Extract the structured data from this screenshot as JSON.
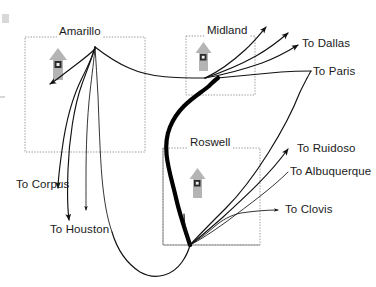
{
  "diagram": {
    "background_color": "#ffffff",
    "line_color": "#111111",
    "box_border_color": "#9a9a9a",
    "north_arrow_color": "#b4b4b4"
  },
  "regions": [
    {
      "id": "amarillo",
      "label": "Amarillo",
      "label_x": 57,
      "label_y": 27,
      "box": {
        "x": 25,
        "y": 37,
        "w": 120,
        "h": 115
      },
      "box_style": "dotted",
      "north_arrow": {
        "x": 50,
        "y": 50,
        "w": 16,
        "h": 30
      }
    },
    {
      "id": "midland",
      "label": "Midland",
      "label_x": 205,
      "label_y": 26,
      "box": {
        "x": 186,
        "y": 36,
        "w": 69,
        "h": 59
      },
      "box_style": "dotted",
      "north_arrow": {
        "x": 196,
        "y": 43,
        "w": 14,
        "h": 27
      }
    },
    {
      "id": "roswell",
      "label": "Roswell",
      "label_x": 188,
      "label_y": 138,
      "box": {
        "x": 163,
        "y": 148,
        "w": 97,
        "h": 97
      },
      "box_style": "solid-dotted",
      "north_arrow": {
        "x": 190,
        "y": 168,
        "w": 14,
        "h": 28
      }
    }
  ],
  "destinations": [
    {
      "id": "to-dallas",
      "label": "To Dallas",
      "x": 302,
      "y": 39
    },
    {
      "id": "to-paris",
      "label": "To Paris",
      "x": 313,
      "y": 73
    },
    {
      "id": "to-ruidoso",
      "label": "To Ruidoso",
      "x": 297,
      "y": 148
    },
    {
      "id": "to-albuquerque",
      "label": "To Albuquerque",
      "x": 290,
      "y": 170
    },
    {
      "id": "to-clovis",
      "label": "To Clovis",
      "x": 285,
      "y": 207
    },
    {
      "id": "to-corpus",
      "label": "To Corpus",
      "x": 16,
      "y": 182
    },
    {
      "id": "to-houston",
      "label": "To Houston",
      "x": 50,
      "y": 227
    }
  ],
  "nodes": [
    {
      "id": "amarillo-node",
      "x": 95,
      "y": 47
    },
    {
      "id": "midland-node",
      "x": 205,
      "y": 78
    },
    {
      "id": "roswell-node",
      "x": 190,
      "y": 245
    }
  ],
  "routes": {
    "trunk_label": "Roswell to Midland trunk",
    "thick_trunk": "M 190,245 C 186,232 180,216 176,198 C 170,172 162,150 170,128 C 178,106 196,96 208,86 C 212,82 214,80 216,78",
    "amarillo_fan": [
      "M 95,47 C 93,56 88,66 82,78 C 74,94 66,120 62,150 C 59,172 58,182 58,190",
      "M 95,47 C 92,58 87,70 82,84 C 74,106 69,140 68,170 C 67,196 68,212 69,222",
      "M 95,47 C 94,60 92,74 90,92 C 87,118 86,150 86,176 C 86,196 86,206 86,212",
      "M 95,47 C 96,62 97,78 98,96 C 99,122 100,154 102,178 C 104,200 107,218 112,232"
    ],
    "amarillo_spur": "M 95,47 C 88,54 78,62 68,70 C 60,76 54,80 48,85",
    "amarillo_to_midland": "M 95,47 C 104,54 114,62 128,68 C 150,78 176,78 205,78",
    "midland_fan": [
      "M 205,78 C 218,72 232,62 246,50 C 256,42 262,34 268,26",
      "M 205,78 C 220,73 238,66 256,56 C 270,48 280,40 290,32",
      "M 205,78 C 222,75 242,70 262,62 C 278,56 290,50 300,44"
    ],
    "midland_to_paris": "M 216,78 C 236,76 258,74 280,72 C 294,71 302,71 310,71",
    "roswell_fan": [
      "M 190,245 C 196,238 204,228 216,214 C 238,188 266,162 290,146",
      "M 190,245 C 198,239 208,230 222,218 C 246,196 272,174 294,162",
      "M 190,245 C 200,240 212,232 226,222 C 250,204 272,190 290,182"
    ],
    "roswell_clovis": "M 190,245 C 198,240 206,234 214,226 C 222,219 230,214 240,212 C 254,210 268,210 280,210",
    "roswell_stub": "M 190,245 C 188,238 186,232 185,226 C 184,221 184,218 184,215",
    "bottom_sweep": "M 112,232 C 116,248 124,262 138,272 C 154,282 172,276 182,262 C 187,255 189,249 190,245",
    "amarillo_lower_curve": "M 102,178 C 106,206 114,232 126,252"
  },
  "arrowheads": [
    {
      "id": "arrow-to-dallas",
      "x": 300,
      "y": 44,
      "angle": -33
    },
    {
      "id": "arrow-midland-up-1",
      "x": 268,
      "y": 26,
      "angle": -55
    },
    {
      "id": "arrow-midland-up-2",
      "x": 290,
      "y": 32,
      "angle": -42
    },
    {
      "id": "arrow-to-ruidoso",
      "x": 291,
      "y": 146,
      "angle": -34
    },
    {
      "id": "arrow-to-clovis",
      "x": 280,
      "y": 210,
      "angle": 0
    },
    {
      "id": "arrow-to-corpus",
      "x": 58,
      "y": 190,
      "angle": 96
    },
    {
      "id": "arrow-to-houston",
      "x": 69,
      "y": 222,
      "angle": 100
    },
    {
      "id": "arrow-amarillo-spur",
      "x": 48,
      "y": 85,
      "angle": 140
    },
    {
      "id": "arrow-midland-trunk",
      "x": 216,
      "y": 78,
      "angle": 190
    },
    {
      "id": "arrow-amarillo-mid",
      "x": 86,
      "y": 212,
      "angle": 92
    }
  ],
  "faint_marks": [
    {
      "id": "corner-mark-top",
      "x": 2,
      "y": 14,
      "w": 7,
      "h": 9
    },
    {
      "id": "edge-mark-left",
      "x": 0,
      "y": 96,
      "w": 5,
      "h": 2
    }
  ]
}
